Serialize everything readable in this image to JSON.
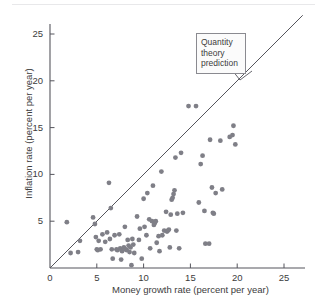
{
  "chart_data": {
    "type": "scatter",
    "title": "",
    "xlabel": "Money growth rate (percent per year)",
    "ylabel": "Inflation rate (percent per year)",
    "xlim": [
      0,
      27.5
    ],
    "ylim": [
      0,
      27.5
    ],
    "xticks": [
      0,
      5,
      10,
      15,
      20,
      25
    ],
    "yticks": [
      5,
      10,
      15,
      20,
      25
    ],
    "xtick_labels": [
      "0",
      "5",
      "10",
      "15",
      "20",
      "25"
    ],
    "ytick_labels": [
      "5",
      "10",
      "15",
      "20",
      "25"
    ],
    "grid": false,
    "legend": "none",
    "marker_color": "#7f7f87",
    "axis_color": "#55555c",
    "line_color": "#55555c",
    "annotations": [
      {
        "name": "quantity-theory-prediction",
        "lines": [
          "Quantity",
          "theory",
          "prediction"
        ],
        "text": "Quantity theory prediction",
        "x": 16.5,
        "y": 24.5
      }
    ],
    "reference_line": {
      "name": "quantity-theory-prediction-line",
      "description": "45 degree line: inflation equals money growth",
      "slope": 1,
      "intercept": 0,
      "x_start": 0,
      "y_start": 0,
      "x_end": 27.0,
      "y_end": 27.0
    },
    "points": [
      [
        1.8,
        4.9
      ],
      [
        2.2,
        1.6
      ],
      [
        3.0,
        1.7
      ],
      [
        3.2,
        2.9
      ],
      [
        4.6,
        5.4
      ],
      [
        4.8,
        4.7
      ],
      [
        4.9,
        3.3
      ],
      [
        5.0,
        2.0
      ],
      [
        5.1,
        1.9
      ],
      [
        5.2,
        2.9
      ],
      [
        5.4,
        2.0
      ],
      [
        5.6,
        3.6
      ],
      [
        5.9,
        2.8
      ],
      [
        6.1,
        3.8
      ],
      [
        6.3,
        9.1
      ],
      [
        6.4,
        3.1
      ],
      [
        6.5,
        6.4
      ],
      [
        6.6,
        2.0
      ],
      [
        6.7,
        1.0
      ],
      [
        6.9,
        3.5
      ],
      [
        7.1,
        2.0
      ],
      [
        7.2,
        1.9
      ],
      [
        7.4,
        3.6
      ],
      [
        7.5,
        2.1
      ],
      [
        7.6,
        0.9
      ],
      [
        7.7,
        1.8
      ],
      [
        7.9,
        2.2
      ],
      [
        8.0,
        4.4
      ],
      [
        8.1,
        2.0
      ],
      [
        8.2,
        1.9
      ],
      [
        8.3,
        3.0
      ],
      [
        8.4,
        2.4
      ],
      [
        8.5,
        1.7
      ],
      [
        8.6,
        2.2
      ],
      [
        8.7,
        0.3
      ],
      [
        8.8,
        3.1
      ],
      [
        8.9,
        2.5
      ],
      [
        9.0,
        1.6
      ],
      [
        9.3,
        5.5
      ],
      [
        9.5,
        3.0
      ],
      [
        9.6,
        4.2
      ],
      [
        9.8,
        1.0
      ],
      [
        10.0,
        7.4
      ],
      [
        10.1,
        4.4
      ],
      [
        10.3,
        3.5
      ],
      [
        10.4,
        8.0
      ],
      [
        10.6,
        5.2
      ],
      [
        10.7,
        2.1
      ],
      [
        10.9,
        5.0
      ],
      [
        11.0,
        8.8
      ],
      [
        11.1,
        4.6
      ],
      [
        11.2,
        4.8
      ],
      [
        11.3,
        5.0
      ],
      [
        11.4,
        2.7
      ],
      [
        11.6,
        3.4
      ],
      [
        11.7,
        1.8
      ],
      [
        11.9,
        10.3
      ],
      [
        12.0,
        3.5
      ],
      [
        12.2,
        4.0
      ],
      [
        12.4,
        6.0
      ],
      [
        12.5,
        3.9
      ],
      [
        12.6,
        4.0
      ],
      [
        12.7,
        4.1
      ],
      [
        12.8,
        2.2
      ],
      [
        12.9,
        5.7
      ],
      [
        13.0,
        7.3
      ],
      [
        13.1,
        7.5
      ],
      [
        13.2,
        7.9
      ],
      [
        13.3,
        8.3
      ],
      [
        13.4,
        11.8
      ],
      [
        13.5,
        4.0
      ],
      [
        13.6,
        5.8
      ],
      [
        13.8,
        2.1
      ],
      [
        14.0,
        12.3
      ],
      [
        14.2,
        5.9
      ],
      [
        14.8,
        17.3
      ],
      [
        15.6,
        17.3
      ],
      [
        15.9,
        7.0
      ],
      [
        16.1,
        11.1
      ],
      [
        16.3,
        12.0
      ],
      [
        16.5,
        6.1
      ],
      [
        16.6,
        2.6
      ],
      [
        17.0,
        2.6
      ],
      [
        17.1,
        13.7
      ],
      [
        17.3,
        8.6
      ],
      [
        17.4,
        5.9
      ],
      [
        17.5,
        5.8
      ],
      [
        17.7,
        8.0
      ],
      [
        18.2,
        13.6
      ],
      [
        18.4,
        8.4
      ],
      [
        19.2,
        14.0
      ],
      [
        19.5,
        14.2
      ],
      [
        19.6,
        15.2
      ],
      [
        19.8,
        13.2
      ]
    ]
  }
}
